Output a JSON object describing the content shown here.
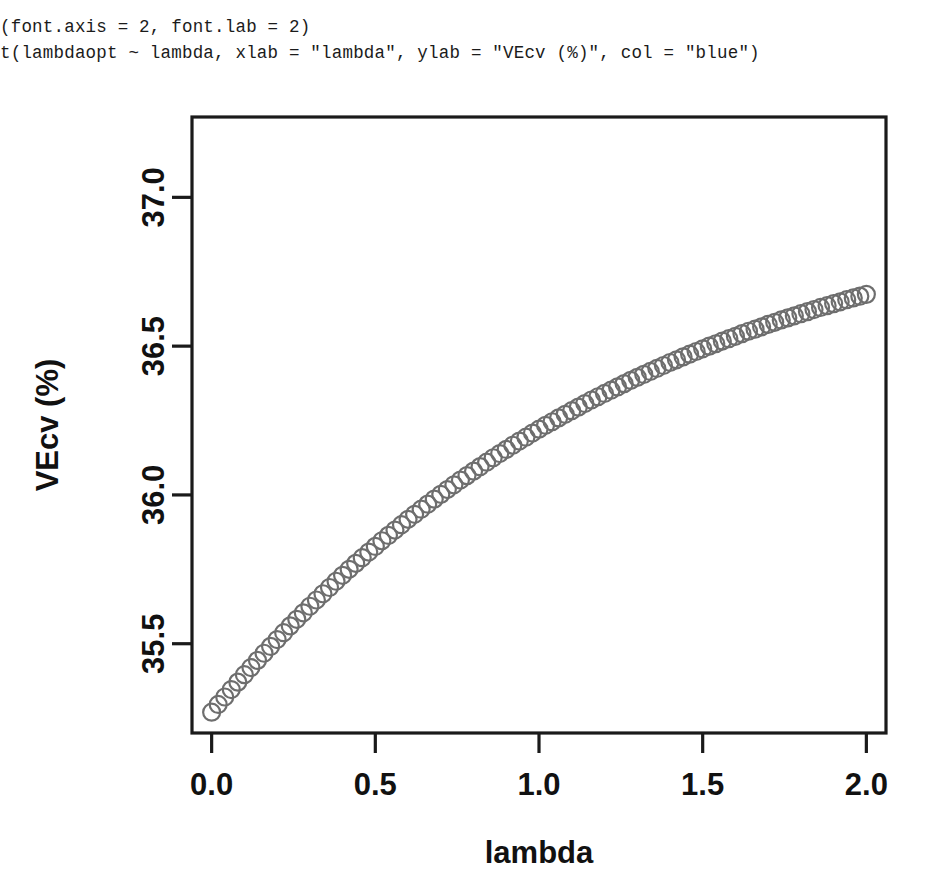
{
  "console": {
    "lines": [
      "(font.axis = 2, font.lab = 2)",
      "t(lambdaopt ~ lambda, xlab = \"lambda\", ylab = \"VEcv (%)\", col = \"blue\")"
    ]
  },
  "chart_data": {
    "type": "scatter",
    "title": "",
    "xlabel": "lambda",
    "ylabel": "VEcv (%)",
    "xlim": [
      -0.06,
      2.06
    ],
    "ylim": [
      35.2,
      37.27
    ],
    "xticks": [
      "0.0",
      "0.5",
      "1.0",
      "1.5",
      "2.0"
    ],
    "xtick_values": [
      0.0,
      0.5,
      1.0,
      1.5,
      2.0
    ],
    "yticks": [
      "35.5",
      "36.0",
      "36.5",
      "37.0"
    ],
    "ytick_values": [
      35.5,
      36.0,
      36.5,
      37.0
    ],
    "grid": false,
    "legend": null,
    "point_style": "open-circle",
    "point_color": "#6e6e6e",
    "point_radius": 8.5,
    "series": [
      {
        "name": "lambdaopt ~ lambda",
        "x": [
          0.0,
          0.02,
          0.04,
          0.06,
          0.08,
          0.1,
          0.12,
          0.14,
          0.16,
          0.18,
          0.2,
          0.22,
          0.24,
          0.26,
          0.28,
          0.3,
          0.32,
          0.34,
          0.36,
          0.38,
          0.4,
          0.42,
          0.44,
          0.46,
          0.48,
          0.5,
          0.52,
          0.54,
          0.56,
          0.58,
          0.6,
          0.62,
          0.64,
          0.66,
          0.68,
          0.7,
          0.72,
          0.74,
          0.76,
          0.78,
          0.8,
          0.82,
          0.84,
          0.86,
          0.88,
          0.9,
          0.92,
          0.94,
          0.96,
          0.98,
          1.0,
          1.02,
          1.04,
          1.06,
          1.08,
          1.1,
          1.12,
          1.14,
          1.16,
          1.18,
          1.2,
          1.22,
          1.24,
          1.26,
          1.28,
          1.3,
          1.32,
          1.34,
          1.36,
          1.38,
          1.4,
          1.42,
          1.44,
          1.46,
          1.48,
          1.5,
          1.52,
          1.54,
          1.56,
          1.58,
          1.6,
          1.62,
          1.64,
          1.66,
          1.68,
          1.7,
          1.72,
          1.74,
          1.76,
          1.78,
          1.8,
          1.82,
          1.84,
          1.86,
          1.88,
          1.9,
          1.92,
          1.94,
          1.96,
          1.98,
          2.0
        ],
        "y": [
          35.27,
          35.296,
          35.321,
          35.346,
          35.371,
          35.396,
          35.42,
          35.444,
          35.468,
          35.491,
          35.514,
          35.537,
          35.56,
          35.582,
          35.604,
          35.626,
          35.647,
          35.668,
          35.689,
          35.71,
          35.73,
          35.75,
          35.77,
          35.789,
          35.808,
          35.827,
          35.846,
          35.864,
          35.882,
          35.9,
          35.918,
          35.935,
          35.952,
          35.969,
          35.986,
          36.002,
          36.018,
          36.034,
          36.05,
          36.065,
          36.08,
          36.095,
          36.11,
          36.125,
          36.139,
          36.153,
          36.167,
          36.181,
          36.194,
          36.208,
          36.221,
          36.234,
          36.246,
          36.259,
          36.271,
          36.283,
          36.295,
          36.307,
          36.319,
          36.33,
          36.341,
          36.352,
          36.363,
          36.374,
          36.385,
          36.395,
          36.405,
          36.415,
          36.425,
          36.435,
          36.445,
          36.454,
          36.464,
          36.473,
          36.482,
          36.491,
          36.5,
          36.508,
          36.517,
          36.525,
          36.533,
          36.542,
          36.55,
          36.557,
          36.565,
          36.573,
          36.58,
          36.588,
          36.595,
          36.602,
          36.609,
          36.616,
          36.623,
          36.63,
          36.636,
          36.643,
          36.649,
          36.656,
          36.662,
          36.668,
          36.674
        ]
      }
    ]
  },
  "colors": {
    "axis": "#1a1a1a",
    "point_stroke": "#6e6e6e",
    "text": "#111111"
  }
}
